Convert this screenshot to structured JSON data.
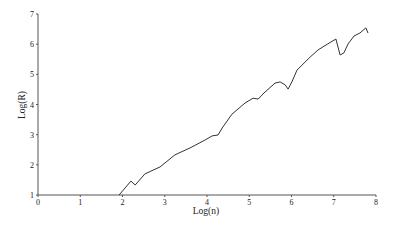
{
  "chart_data": {
    "type": "line",
    "title": "",
    "xlabel": "Log(n)",
    "ylabel": "Log(R)",
    "xlim": [
      0,
      8
    ],
    "ylim": [
      1,
      7
    ],
    "xticks": [
      "0",
      "1",
      "2",
      "3",
      "4",
      "5",
      "6",
      "7",
      "8"
    ],
    "yticks": [
      "1",
      "2",
      "3",
      "4",
      "5",
      "6",
      "7"
    ],
    "grid": false,
    "legend": null,
    "series": [
      {
        "name": "Log(R) vs Log(n)",
        "x": [
          1.92,
          2.2,
          2.3,
          2.53,
          2.89,
          3.24,
          3.6,
          3.95,
          4.12,
          4.26,
          4.36,
          4.59,
          4.9,
          5.09,
          5.21,
          5.35,
          5.61,
          5.73,
          5.85,
          5.92,
          6.01,
          6.13,
          6.44,
          6.63,
          6.86,
          7.05,
          7.15,
          7.24,
          7.34,
          7.48,
          7.62,
          7.76,
          7.81
        ],
        "y": [
          1.0,
          1.46,
          1.33,
          1.7,
          1.93,
          2.33,
          2.56,
          2.82,
          2.96,
          2.99,
          3.22,
          3.68,
          4.05,
          4.21,
          4.18,
          4.38,
          4.71,
          4.75,
          4.65,
          4.51,
          4.75,
          5.14,
          5.57,
          5.81,
          6.01,
          6.17,
          5.64,
          5.71,
          6.01,
          6.27,
          6.37,
          6.54,
          6.37
        ]
      }
    ]
  }
}
